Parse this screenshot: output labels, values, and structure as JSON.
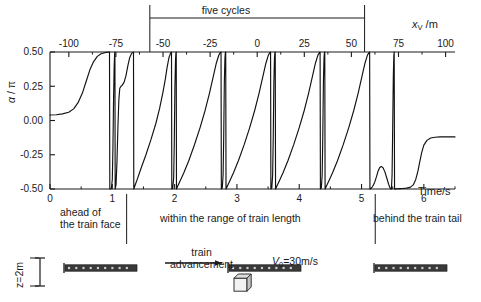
{
  "figure": {
    "top_axis": {
      "label": "x_V /m",
      "label_base": "x",
      "label_sub": "V",
      "label_unit": " /m",
      "ticks": [
        -100,
        -75,
        -50,
        -25,
        0,
        25,
        50,
        75,
        100
      ],
      "tick_labels": [
        "-100",
        "-75",
        "-50",
        "-25",
        "0",
        "25",
        "50",
        "75",
        "100"
      ],
      "range": [
        -110,
        105
      ]
    },
    "bracket": {
      "label": "five cycles",
      "start_value": -57,
      "end_value": 57
    },
    "regions": [
      {
        "label_line1": "ahead of",
        "label_line2": "the train face",
        "divider_time": 1.23
      },
      {
        "label_line1": "within the range of train length",
        "label_line2": "",
        "divider_time": 5.22
      },
      {
        "label_line1": "behind the train tail",
        "label_line2": "",
        "divider_time": null
      }
    ],
    "annotations": {
      "train_advancement_line1": "train",
      "train_advancement_line2": "advancement",
      "speed": "V0=30m/s",
      "speed_base": "V",
      "speed_sub": "0",
      "speed_rest": "=30m/s",
      "height_scale": "z=2m"
    },
    "icons": {
      "train_left": "train-icon",
      "train_middle": "train-icon",
      "train_right": "train-icon",
      "arrow": "right-arrow-icon",
      "cube": "cube-icon",
      "scale_bar": "vertical-scale-icon"
    }
  },
  "chart_data": {
    "type": "line",
    "title": "",
    "xlabel": "Time/s",
    "ylabel": "a / p",
    "ylabel_alpha": "α",
    "ylabel_slash": " / ",
    "ylabel_pi": "π",
    "xlim": [
      0,
      6.5
    ],
    "ylim": [
      -0.5,
      0.5
    ],
    "yticks": [
      -0.5,
      -0.25,
      0,
      0.25,
      0.5
    ],
    "ytick_labels": [
      "-0.50",
      "-0.25",
      "0.00",
      "0.25",
      "0.50"
    ],
    "xticks": [
      0,
      1,
      2,
      3,
      4,
      5,
      6
    ],
    "xtick_labels": [
      "0",
      "1",
      "2",
      "3",
      "4",
      "5",
      "6"
    ],
    "xminorticks": [
      0.5,
      1.5,
      2.5,
      3.5,
      4.5,
      5.5,
      6.5
    ],
    "grid": false,
    "legend": null,
    "series": [
      {
        "name": "alpha over pi",
        "comment": "sawtooth-like phase trace; values are alpha/pi in [-0.5,0.5] vs time in s",
        "points": [
          [
            0.0,
            0.04
          ],
          [
            0.1,
            0.042
          ],
          [
            0.2,
            0.048
          ],
          [
            0.3,
            0.06
          ],
          [
            0.38,
            0.085
          ],
          [
            0.45,
            0.13
          ],
          [
            0.52,
            0.2
          ],
          [
            0.58,
            0.285
          ],
          [
            0.64,
            0.37
          ],
          [
            0.7,
            0.43
          ],
          [
            0.76,
            0.468
          ],
          [
            0.82,
            0.487
          ],
          [
            0.88,
            0.495
          ],
          [
            0.92,
            0.498
          ],
          [
            0.955,
            0.499
          ],
          [
            0.96,
            -0.5
          ],
          [
            0.985,
            -0.498
          ],
          [
            1.0,
            -0.43
          ],
          [
            1.01,
            -0.2
          ],
          [
            1.02,
            0.15
          ],
          [
            1.03,
            0.4
          ],
          [
            1.038,
            0.495
          ],
          [
            1.042,
            0.499
          ],
          [
            1.046,
            -0.5
          ],
          [
            1.06,
            -0.47
          ],
          [
            1.075,
            -0.3
          ],
          [
            1.09,
            -0.05
          ],
          [
            1.105,
            0.15
          ],
          [
            1.12,
            0.235
          ],
          [
            1.14,
            0.25
          ],
          [
            1.16,
            0.258
          ],
          [
            1.19,
            0.28
          ],
          [
            1.22,
            0.33
          ],
          [
            1.25,
            0.4
          ],
          [
            1.28,
            0.46
          ],
          [
            1.31,
            0.49
          ],
          [
            1.34,
            0.499
          ],
          [
            1.345,
            -0.5
          ],
          [
            1.36,
            -0.48
          ],
          [
            1.4,
            -0.43
          ],
          [
            1.46,
            -0.35
          ],
          [
            1.54,
            -0.25
          ],
          [
            1.62,
            -0.14
          ],
          [
            1.7,
            -0.02
          ],
          [
            1.76,
            0.09
          ],
          [
            1.81,
            0.2
          ],
          [
            1.85,
            0.3
          ],
          [
            1.88,
            0.39
          ],
          [
            1.91,
            0.46
          ],
          [
            1.935,
            0.492
          ],
          [
            1.95,
            0.499
          ],
          [
            1.955,
            -0.5
          ],
          [
            1.97,
            -0.495
          ],
          [
            1.985,
            -0.42
          ],
          [
            1.995,
            -0.15
          ],
          [
            2.005,
            0.25
          ],
          [
            2.015,
            0.45
          ],
          [
            2.022,
            0.497
          ],
          [
            2.026,
            0.499
          ],
          [
            2.03,
            -0.5
          ],
          [
            2.05,
            -0.478
          ],
          [
            2.09,
            -0.44
          ],
          [
            2.15,
            -0.38
          ],
          [
            2.23,
            -0.29
          ],
          [
            2.32,
            -0.175
          ],
          [
            2.41,
            -0.05
          ],
          [
            2.49,
            0.075
          ],
          [
            2.56,
            0.2
          ],
          [
            2.62,
            0.32
          ],
          [
            2.67,
            0.42
          ],
          [
            2.71,
            0.478
          ],
          [
            2.735,
            0.497
          ],
          [
            2.745,
            0.499
          ],
          [
            2.75,
            -0.5
          ],
          [
            2.765,
            -0.492
          ],
          [
            2.778,
            -0.4
          ],
          [
            2.788,
            -0.12
          ],
          [
            2.798,
            0.28
          ],
          [
            2.808,
            0.46
          ],
          [
            2.815,
            0.498
          ],
          [
            2.82,
            0.499
          ],
          [
            2.825,
            -0.5
          ],
          [
            2.845,
            -0.48
          ],
          [
            2.885,
            -0.442
          ],
          [
            2.945,
            -0.382
          ],
          [
            3.025,
            -0.292
          ],
          [
            3.115,
            -0.178
          ],
          [
            3.205,
            -0.052
          ],
          [
            3.285,
            0.073
          ],
          [
            3.355,
            0.198
          ],
          [
            3.415,
            0.318
          ],
          [
            3.465,
            0.418
          ],
          [
            3.505,
            0.477
          ],
          [
            3.53,
            0.497
          ],
          [
            3.54,
            0.499
          ],
          [
            3.545,
            -0.5
          ],
          [
            3.56,
            -0.492
          ],
          [
            3.573,
            -0.4
          ],
          [
            3.583,
            -0.12
          ],
          [
            3.593,
            0.28
          ],
          [
            3.603,
            0.46
          ],
          [
            3.61,
            0.498
          ],
          [
            3.615,
            0.499
          ],
          [
            3.62,
            -0.5
          ],
          [
            3.64,
            -0.48
          ],
          [
            3.68,
            -0.442
          ],
          [
            3.74,
            -0.382
          ],
          [
            3.82,
            -0.292
          ],
          [
            3.91,
            -0.178
          ],
          [
            4.0,
            -0.052
          ],
          [
            4.08,
            0.073
          ],
          [
            4.15,
            0.198
          ],
          [
            4.21,
            0.318
          ],
          [
            4.26,
            0.418
          ],
          [
            4.3,
            0.477
          ],
          [
            4.325,
            0.497
          ],
          [
            4.335,
            0.499
          ],
          [
            4.34,
            -0.5
          ],
          [
            4.355,
            -0.492
          ],
          [
            4.368,
            -0.4
          ],
          [
            4.378,
            -0.12
          ],
          [
            4.388,
            0.28
          ],
          [
            4.398,
            0.46
          ],
          [
            4.405,
            0.498
          ],
          [
            4.41,
            0.499
          ],
          [
            4.415,
            -0.5
          ],
          [
            4.435,
            -0.48
          ],
          [
            4.475,
            -0.442
          ],
          [
            4.535,
            -0.382
          ],
          [
            4.615,
            -0.292
          ],
          [
            4.705,
            -0.178
          ],
          [
            4.795,
            -0.052
          ],
          [
            4.875,
            0.073
          ],
          [
            4.945,
            0.198
          ],
          [
            5.005,
            0.318
          ],
          [
            5.055,
            0.418
          ],
          [
            5.095,
            0.477
          ],
          [
            5.12,
            0.497
          ],
          [
            5.13,
            0.499
          ],
          [
            5.135,
            -0.5
          ],
          [
            5.155,
            -0.495
          ],
          [
            5.18,
            -0.48
          ],
          [
            5.21,
            -0.452
          ],
          [
            5.24,
            -0.41
          ],
          [
            5.265,
            -0.37
          ],
          [
            5.29,
            -0.345
          ],
          [
            5.315,
            -0.335
          ],
          [
            5.345,
            -0.345
          ],
          [
            5.375,
            -0.375
          ],
          [
            5.405,
            -0.42
          ],
          [
            5.435,
            -0.465
          ],
          [
            5.455,
            -0.49
          ],
          [
            5.47,
            -0.499
          ],
          [
            5.48,
            -0.499
          ],
          [
            5.49,
            -0.4
          ],
          [
            5.5,
            -0.06
          ],
          [
            5.51,
            0.32
          ],
          [
            5.518,
            0.47
          ],
          [
            5.524,
            0.499
          ],
          [
            5.53,
            -0.5
          ],
          [
            5.545,
            -0.499
          ],
          [
            5.57,
            -0.498
          ],
          [
            5.61,
            -0.497
          ],
          [
            5.66,
            -0.496
          ],
          [
            5.72,
            -0.494
          ],
          [
            5.78,
            -0.488
          ],
          [
            5.83,
            -0.47
          ],
          [
            5.87,
            -0.43
          ],
          [
            5.905,
            -0.37
          ],
          [
            5.935,
            -0.3
          ],
          [
            5.965,
            -0.235
          ],
          [
            6.0,
            -0.18
          ],
          [
            6.05,
            -0.145
          ],
          [
            6.11,
            -0.128
          ],
          [
            6.18,
            -0.122
          ],
          [
            6.26,
            -0.12
          ],
          [
            6.35,
            -0.12
          ],
          [
            6.43,
            -0.12
          ],
          [
            6.5,
            -0.12
          ]
        ]
      }
    ]
  }
}
